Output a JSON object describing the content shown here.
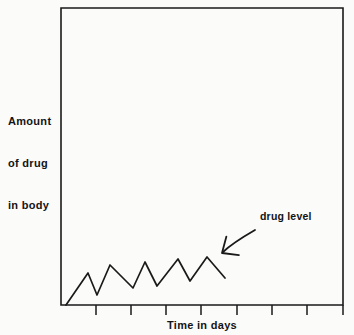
{
  "figure": {
    "background_color": "#fbfbfa",
    "ink_color": "#1a1a1a",
    "y_axis_label_lines": [
      "Amount",
      "of drug",
      "in body"
    ],
    "y_axis_label_text": "Amount of drug in body",
    "x_axis_label": "Time in days",
    "annotation_label": "drug level"
  },
  "chart_data": {
    "type": "line",
    "title": "",
    "subtitle": "",
    "xlabel": "Time in days",
    "ylabel": "Amount of drug in body",
    "grid": false,
    "legend_position": "none",
    "annotations": [
      {
        "text": "drug level",
        "target": "drug-level-curve",
        "arrow": true,
        "arrow_from_x": 255,
        "arrow_from_y": 231,
        "arrow_to_x": 222,
        "arrow_to_y": 253
      }
    ],
    "axes": {
      "x_tick_labels": [],
      "y_tick_labels": [],
      "x_tick_count": 8,
      "y_tick_count": 0,
      "xlim": [
        0,
        8
      ],
      "ylim": [
        0,
        10
      ],
      "frame_left_px": 61,
      "frame_top_px": 8,
      "frame_right_px": 343,
      "frame_bottom_px": 305,
      "x_tick_positions_px": [
        96,
        131,
        166,
        201,
        237,
        272,
        307,
        343
      ]
    },
    "series": [
      {
        "name": "drug level",
        "description": "Sawtooth accumulation curve: repeated dose rises followed by decay, with peaks and troughs climbing toward a steady state.",
        "points_px": [
          [
            66,
            305
          ],
          [
            88,
            273
          ],
          [
            97,
            295
          ],
          [
            110,
            265
          ],
          [
            133,
            288
          ],
          [
            145,
            262
          ],
          [
            157,
            286
          ],
          [
            178,
            259
          ],
          [
            190,
            281
          ],
          [
            207,
            257
          ],
          [
            225,
            278
          ]
        ],
        "peaks_px": [
          [
            88,
            273
          ],
          [
            110,
            265
          ],
          [
            145,
            262
          ],
          [
            178,
            259
          ],
          [
            207,
            257
          ]
        ],
        "troughs_px": [
          [
            97,
            295
          ],
          [
            133,
            288
          ],
          [
            157,
            286
          ],
          [
            190,
            281
          ]
        ],
        "x": [
          0.0,
          0.78,
          1.05,
          1.49,
          2.29,
          2.71,
          3.12,
          3.87,
          4.29,
          5.11,
          5.72
        ],
        "y": [
          0.0,
          1.08,
          0.34,
          1.35,
          0.57,
          1.45,
          0.64,
          1.55,
          0.81,
          1.62,
          0.91
        ]
      }
    ]
  }
}
